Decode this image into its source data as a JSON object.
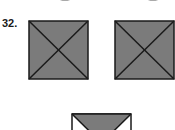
{
  "question": {
    "number_label": "32."
  },
  "colors": {
    "shade": "#7b7b7b",
    "line": "#1a1a1a",
    "background": "#ffffff"
  },
  "figures": [
    {
      "name": "square-1",
      "shaded_triangles": [
        "top",
        "right",
        "bottom",
        "left"
      ]
    },
    {
      "name": "square-2",
      "shaded_triangles": [
        "top",
        "right",
        "bottom",
        "left"
      ]
    },
    {
      "name": "square-3-partial",
      "shaded_triangles": [
        "top"
      ]
    }
  ]
}
